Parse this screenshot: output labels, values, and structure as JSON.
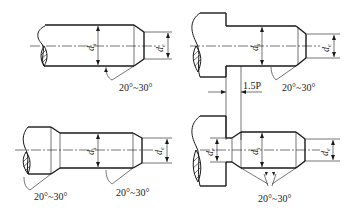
{
  "figure": {
    "type": "engineering-drawing",
    "views": [
      {
        "id": "top-left",
        "labels": {
          "major_diameter": "d",
          "major_sub": "s",
          "end_diameter": "d",
          "end_sub": "e",
          "angle": "20°~30°"
        }
      },
      {
        "id": "top-right",
        "labels": {
          "major_diameter": "d",
          "major_sub": "s",
          "end_diameter": "d",
          "end_sub": "e",
          "angle": "20°~30°",
          "undercut": "1.5P"
        }
      },
      {
        "id": "bottom-left",
        "labels": {
          "major_diameter": "d",
          "major_sub": "s",
          "end_diameter": "d",
          "end_sub": "e",
          "angle_left": "20°~30°",
          "angle_right": "20°~30°"
        }
      },
      {
        "id": "bottom-right",
        "labels": {
          "neck_diameter": "d",
          "neck_sub": "e",
          "major_diameter": "d",
          "major_sub": "s",
          "end_diameter": "d",
          "end_sub": "e",
          "angle": "20°~30°"
        }
      }
    ]
  }
}
